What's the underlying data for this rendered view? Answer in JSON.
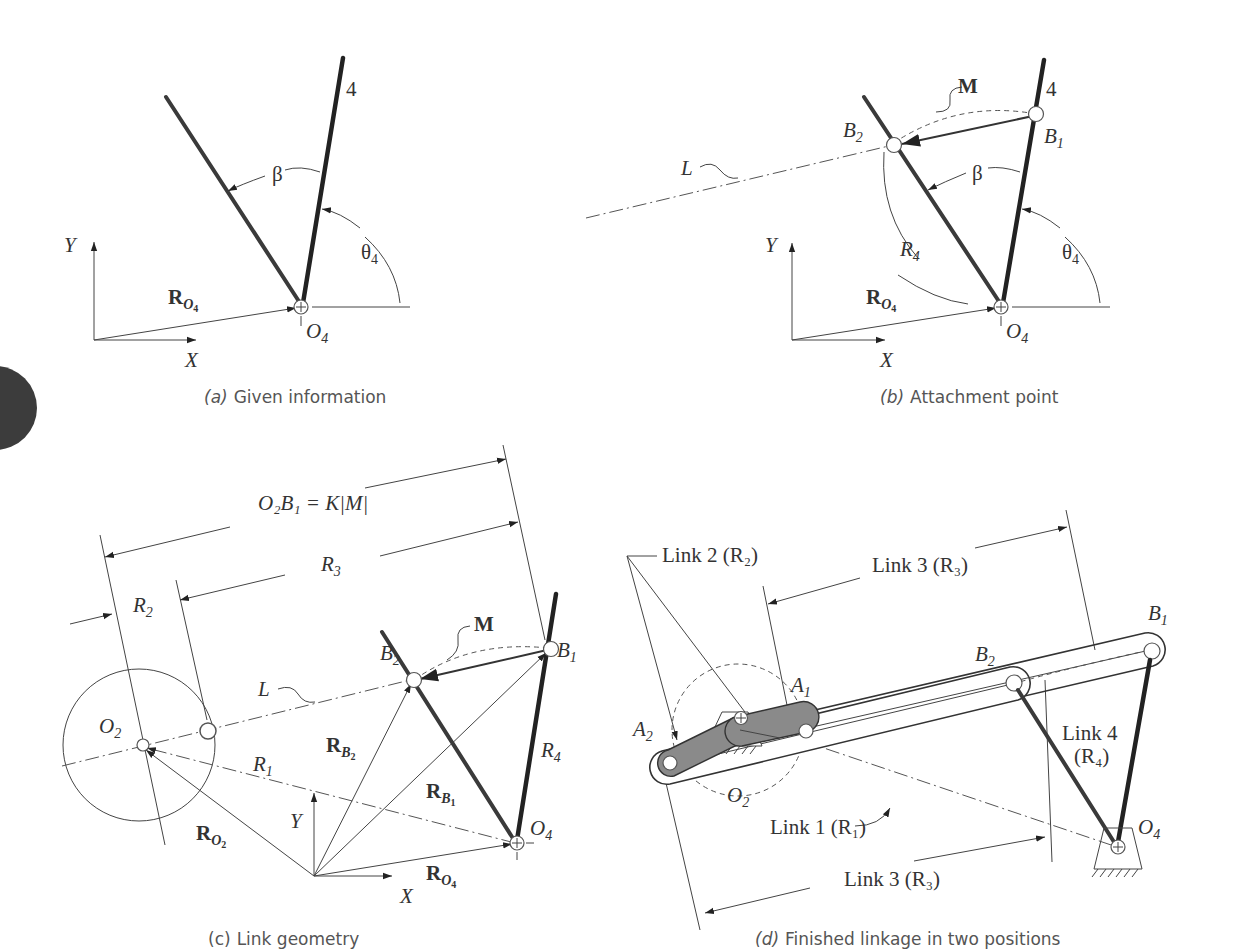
{
  "figure": {
    "panels": [
      {
        "id": "a",
        "caption_letter": "(a)",
        "caption_text": "Given information",
        "labels": {
          "link_number": "4",
          "beta": "β",
          "theta": "θ",
          "theta_sub": "4",
          "r_o4": "R",
          "r_o4_sub": "O",
          "r_o4_subsub": "4",
          "o4": "O",
          "o4_sub": "4",
          "x_axis": "X",
          "y_axis": "Y"
        }
      },
      {
        "id": "b",
        "caption_letter": "(b)",
        "caption_text": "Attachment point",
        "labels": {
          "link_number": "4",
          "m": "M",
          "b1": "B",
          "b1_sub": "1",
          "b2": "B",
          "b2_sub": "2",
          "l": "L",
          "beta": "β",
          "r4": "R",
          "r4_sub": "4",
          "theta": "θ",
          "theta_sub": "4",
          "r_o4": "R",
          "r_o4_sub": "O",
          "r_o4_subsub": "4",
          "o4": "O",
          "o4_sub": "4",
          "x_axis": "X",
          "y_axis": "Y"
        }
      },
      {
        "id": "c",
        "caption_letter": "(c)",
        "caption_text": "Link geometry",
        "labels": {
          "o2b1_eq": "O₂B₁ = K|M|",
          "r3": "R",
          "r3_sub": "3",
          "r2": "R",
          "r2_sub": "2",
          "m": "M",
          "b1": "B",
          "b1_sub": "1",
          "b2": "B",
          "b2_sub": "2",
          "l": "L",
          "o2": "O",
          "o2_sub": "2",
          "r1": "R",
          "r1_sub": "1",
          "rb2": "R",
          "rb2_sub": "B",
          "rb2_subsub": "2",
          "rb1": "R",
          "rb1_sub": "B",
          "rb1_subsub": "1",
          "r4": "R",
          "r4_sub": "4",
          "ro2": "R",
          "ro2_sub": "O",
          "ro2_subsub": "2",
          "o4": "O",
          "o4_sub": "4",
          "ro4": "R",
          "ro4_sub": "O",
          "ro4_subsub": "4",
          "x_axis": "X",
          "y_axis": "Y"
        }
      },
      {
        "id": "d",
        "caption_letter": "(d)",
        "caption_text": "Finished linkage in two positions",
        "labels": {
          "link2": "Link 2 (R₂)",
          "link3_top": "Link 3 (R₃)",
          "link3_bottom": "Link 3 (R₃)",
          "link1": "Link 1 (R₁)",
          "link4_line1": "Link 4",
          "link4_line2": "(R₄)",
          "b1": "B",
          "b1_sub": "1",
          "b2": "B",
          "b2_sub": "2",
          "a1": "A",
          "a1_sub": "1",
          "a2": "A",
          "a2_sub": "2",
          "o2": "O",
          "o2_sub": "2",
          "o4": "O",
          "o4_sub": "4"
        }
      }
    ],
    "colors": {
      "line": "#444444",
      "link_fill": "#8a8a8a",
      "caption": "#555555",
      "edge_tab": "#3c3c3c"
    }
  }
}
